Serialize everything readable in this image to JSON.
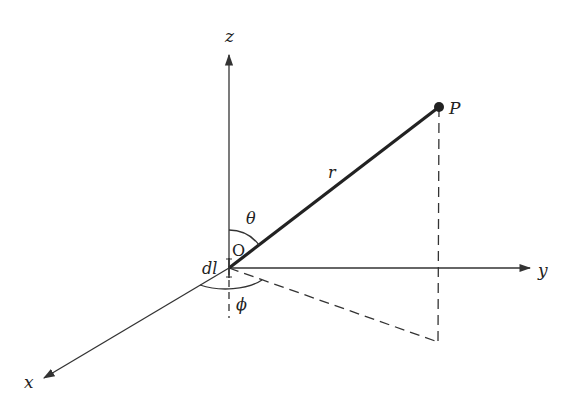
{
  "diagram": {
    "colors": {
      "line": "#333333",
      "background": "#ffffff"
    },
    "axes": {
      "z": {
        "label": "z"
      },
      "y": {
        "label": "y"
      },
      "x": {
        "label": "x"
      }
    },
    "labels": {
      "origin": "O",
      "element": "dl",
      "point": "P",
      "radius": "r",
      "theta": "θ",
      "phi": "ϕ"
    }
  }
}
